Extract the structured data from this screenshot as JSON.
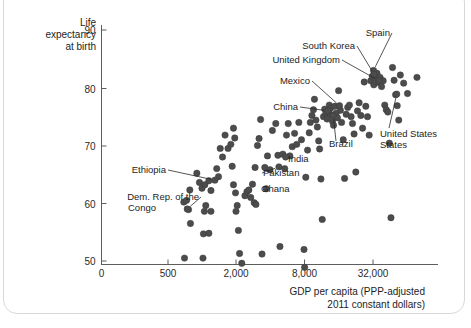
{
  "chart_data": {
    "type": "scatter",
    "title": "",
    "xlabel": "GDP per capita (PPP-adjusted 2011 constant dollars)",
    "xlabel_line1": "GDP per capita (PPP-adjusted",
    "xlabel_line2": "2011 constant dollars)",
    "ylabel": "Life expectancy at birth",
    "ylabel_line1": "Life",
    "ylabel_line2": "expectancy",
    "ylabel_line3": "at birth",
    "xscale": "log",
    "yscale": "linear",
    "grid": false,
    "legend": "none",
    "xticks": [
      {
        "label": "0",
        "value": 0
      },
      {
        "label": "500",
        "value": 500
      },
      {
        "label": "2,000",
        "value": 2000
      },
      {
        "label": "8,000",
        "value": 8000
      },
      {
        "label": "32,000",
        "value": 32000
      }
    ],
    "yticks": [
      {
        "label": "90",
        "value": 90
      },
      {
        "label": "80",
        "value": 80
      },
      {
        "label": "70",
        "value": 70
      },
      {
        "label": "60",
        "value": 60
      },
      {
        "label": "50",
        "value": 50
      }
    ],
    "ylim": [
      47,
      91
    ],
    "xlim": [
      280,
      95000
    ],
    "point_color": "#4c4c4c",
    "annotations": [
      {
        "label": "Spain",
        "gdp": 33000,
        "life": 83.0
      },
      {
        "label": "South Korea",
        "gdp": 33500,
        "life": 82.3
      },
      {
        "label": "United Kingdom",
        "gdp": 37000,
        "life": 81.2
      },
      {
        "label": "Mexico",
        "gdp": 16500,
        "life": 76.9
      },
      {
        "label": "China",
        "gdp": 13000,
        "life": 76.0
      },
      {
        "label": "Brazil",
        "gdp": 14500,
        "life": 75.2
      },
      {
        "label": "United States",
        "gdp": 53000,
        "life": 78.9
      },
      {
        "label": "India",
        "gdp": 5500,
        "life": 68.0
      },
      {
        "label": "Pakistan",
        "gdp": 4800,
        "life": 66.3
      },
      {
        "label": "Ghana",
        "gdp": 3700,
        "life": 62.5
      },
      {
        "label": "Ethiopia",
        "gdp": 1300,
        "life": 64.0
      },
      {
        "label": "Dem. Rep. of the Congo",
        "label_line1": "Dem. Rep. of the",
        "label_line2": "Congo",
        "gdp": 740,
        "life": 59.0
      }
    ],
    "points": [
      {
        "gdp": 700,
        "life": 50.5
      },
      {
        "gdp": 790,
        "life": 56.5
      },
      {
        "gdp": 690,
        "life": 60.2
      },
      {
        "gdp": 730,
        "life": 60.5
      },
      {
        "gdp": 780,
        "life": 62.3
      },
      {
        "gdp": 760,
        "life": 58.9
      },
      {
        "gdp": 900,
        "life": 65.2
      },
      {
        "gdp": 950,
        "life": 63.6
      },
      {
        "gdp": 1000,
        "life": 62.6
      },
      {
        "gdp": 1060,
        "life": 63.2
      },
      {
        "gdp": 1150,
        "life": 63.9
      },
      {
        "gdp": 1200,
        "life": 62.2
      },
      {
        "gdp": 1050,
        "life": 58.6
      },
      {
        "gdp": 1080,
        "life": 59.6
      },
      {
        "gdp": 1200,
        "life": 58.6
      },
      {
        "gdp": 1030,
        "life": 54.7
      },
      {
        "gdp": 1150,
        "life": 54.8
      },
      {
        "gdp": 1020,
        "life": 50.5
      },
      {
        "gdp": 1350,
        "life": 66.0
      },
      {
        "gdp": 1400,
        "life": 64.6
      },
      {
        "gdp": 1450,
        "life": 69.5
      },
      {
        "gdp": 1520,
        "life": 68.0
      },
      {
        "gdp": 1600,
        "life": 71.8
      },
      {
        "gdp": 1700,
        "life": 69.5
      },
      {
        "gdp": 1800,
        "life": 70.2
      },
      {
        "gdp": 1900,
        "life": 73.0
      },
      {
        "gdp": 1950,
        "life": 71.3
      },
      {
        "gdp": 1850,
        "life": 66.4
      },
      {
        "gdp": 1900,
        "life": 63.2
      },
      {
        "gdp": 1980,
        "life": 61.8
      },
      {
        "gdp": 2000,
        "life": 58.6
      },
      {
        "gdp": 2050,
        "life": 59.6
      },
      {
        "gdp": 2100,
        "life": 55.3
      },
      {
        "gdp": 2150,
        "life": 51.3
      },
      {
        "gdp": 2250,
        "life": 49.6
      },
      {
        "gdp": 2400,
        "life": 61.3
      },
      {
        "gdp": 2500,
        "life": 62.0
      },
      {
        "gdp": 2600,
        "life": 62.3
      },
      {
        "gdp": 2700,
        "life": 61.0
      },
      {
        "gdp": 2800,
        "life": 63.3
      },
      {
        "gdp": 2900,
        "life": 60.1
      },
      {
        "gdp": 3000,
        "life": 59.8
      },
      {
        "gdp": 2950,
        "life": 66.2
      },
      {
        "gdp": 3100,
        "life": 70.0
      },
      {
        "gdp": 3200,
        "life": 71.2
      },
      {
        "gdp": 3300,
        "life": 74.5
      },
      {
        "gdp": 3400,
        "life": 51.2
      },
      {
        "gdp": 3600,
        "life": 66.2
      },
      {
        "gdp": 3800,
        "life": 68.2
      },
      {
        "gdp": 4000,
        "life": 65.8
      },
      {
        "gdp": 4200,
        "life": 72.6
      },
      {
        "gdp": 4500,
        "life": 73.8
      },
      {
        "gdp": 4700,
        "life": 68.3
      },
      {
        "gdp": 4900,
        "life": 52.5
      },
      {
        "gdp": 5200,
        "life": 68.5
      },
      {
        "gdp": 5400,
        "life": 66.0
      },
      {
        "gdp": 5600,
        "life": 71.8
      },
      {
        "gdp": 5800,
        "life": 73.8
      },
      {
        "gdp": 6000,
        "life": 68.2
      },
      {
        "gdp": 6300,
        "life": 69.8
      },
      {
        "gdp": 6600,
        "life": 72.1
      },
      {
        "gdp": 6900,
        "life": 70.2
      },
      {
        "gdp": 7200,
        "life": 74.0
      },
      {
        "gdp": 7600,
        "life": 71.0
      },
      {
        "gdp": 8000,
        "life": 52.0
      },
      {
        "gdp": 8100,
        "life": 48.9
      },
      {
        "gdp": 8300,
        "life": 64.5
      },
      {
        "gdp": 8600,
        "life": 69.2
      },
      {
        "gdp": 8900,
        "life": 72.2
      },
      {
        "gdp": 9100,
        "life": 74.0
      },
      {
        "gdp": 9400,
        "life": 75.2
      },
      {
        "gdp": 9700,
        "life": 76.2
      },
      {
        "gdp": 9900,
        "life": 78.0
      },
      {
        "gdp": 10200,
        "life": 74.4
      },
      {
        "gdp": 10500,
        "life": 73.2
      },
      {
        "gdp": 10800,
        "life": 70.8
      },
      {
        "gdp": 11000,
        "life": 69.4
      },
      {
        "gdp": 11300,
        "life": 64.2
      },
      {
        "gdp": 11600,
        "life": 57.2
      },
      {
        "gdp": 11900,
        "life": 75.0
      },
      {
        "gdp": 12200,
        "life": 76.3
      },
      {
        "gdp": 12500,
        "life": 75.6
      },
      {
        "gdp": 12800,
        "life": 74.6
      },
      {
        "gdp": 13100,
        "life": 75.9
      },
      {
        "gdp": 13400,
        "life": 77.0
      },
      {
        "gdp": 13700,
        "life": 76.4
      },
      {
        "gdp": 14000,
        "life": 75.3
      },
      {
        "gdp": 14300,
        "life": 74.2
      },
      {
        "gdp": 14600,
        "life": 73.5
      },
      {
        "gdp": 15000,
        "life": 76.8
      },
      {
        "gdp": 15400,
        "life": 75.6
      },
      {
        "gdp": 15800,
        "life": 74.8
      },
      {
        "gdp": 16200,
        "life": 79.5
      },
      {
        "gdp": 16800,
        "life": 76.1
      },
      {
        "gdp": 17200,
        "life": 74.0
      },
      {
        "gdp": 17800,
        "life": 71.0
      },
      {
        "gdp": 18300,
        "life": 64.3
      },
      {
        "gdp": 18900,
        "life": 75.4
      },
      {
        "gdp": 19500,
        "life": 76.6
      },
      {
        "gdp": 20200,
        "life": 77.0
      },
      {
        "gdp": 20900,
        "life": 75.0
      },
      {
        "gdp": 21500,
        "life": 73.8
      },
      {
        "gdp": 22200,
        "life": 72.0
      },
      {
        "gdp": 23000,
        "life": 65.4
      },
      {
        "gdp": 23800,
        "life": 76.0
      },
      {
        "gdp": 24600,
        "life": 77.4
      },
      {
        "gdp": 25500,
        "life": 75.2
      },
      {
        "gdp": 26400,
        "life": 73.0
      },
      {
        "gdp": 27300,
        "life": 81.0
      },
      {
        "gdp": 28200,
        "life": 76.8
      },
      {
        "gdp": 29200,
        "life": 75.0
      },
      {
        "gdp": 30200,
        "life": 71.8
      },
      {
        "gdp": 31200,
        "life": 81.2
      },
      {
        "gdp": 32200,
        "life": 82.0
      },
      {
        "gdp": 33200,
        "life": 80.5
      },
      {
        "gdp": 34300,
        "life": 81.6
      },
      {
        "gdp": 35400,
        "life": 82.5
      },
      {
        "gdp": 36500,
        "life": 80.9
      },
      {
        "gdp": 37700,
        "life": 81.8
      },
      {
        "gdp": 38900,
        "life": 80.2
      },
      {
        "gdp": 40200,
        "life": 81.2
      },
      {
        "gdp": 41500,
        "life": 77.0
      },
      {
        "gdp": 42800,
        "life": 76.2
      },
      {
        "gdp": 44200,
        "life": 75.8
      },
      {
        "gdp": 45600,
        "life": 70.4
      },
      {
        "gdp": 47100,
        "life": 57.5
      },
      {
        "gdp": 48600,
        "life": 83.5
      },
      {
        "gdp": 50200,
        "life": 81.3
      },
      {
        "gdp": 51800,
        "life": 78.8
      },
      {
        "gdp": 53500,
        "life": 76.9
      },
      {
        "gdp": 55200,
        "life": 74.4
      },
      {
        "gdp": 57000,
        "life": 82.2
      },
      {
        "gdp": 61000,
        "life": 80.8
      },
      {
        "gdp": 66000,
        "life": 79.0
      },
      {
        "gdp": 80000,
        "life": 81.8
      }
    ]
  }
}
